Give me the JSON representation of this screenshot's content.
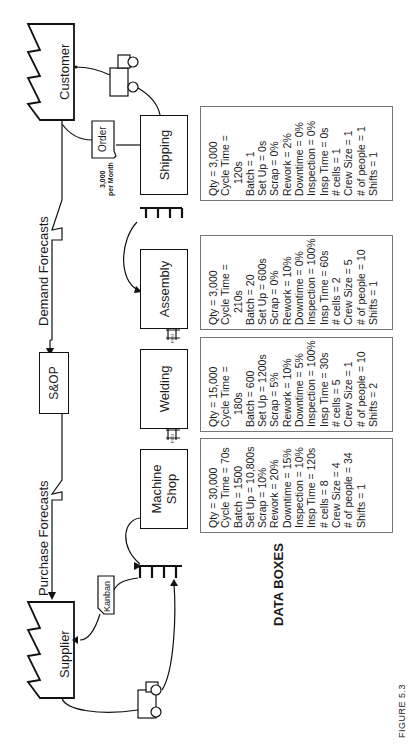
{
  "figure": {
    "caption": "FIGURE 5.3",
    "data_boxes_title": "DATA BOXES",
    "orientation": "rotated -90deg (text reads bottom-to-top)"
  },
  "entities": {
    "customer": "Customer",
    "supplier": "Supplier",
    "sop": "S&OP"
  },
  "info_flows": {
    "demand_forecasts": "Demand Forecasts",
    "purchase_forecasts": "Purchase Forecasts",
    "order_card": "Order",
    "order_volume_line1": "3,000",
    "order_volume_line2": "per Month",
    "kanban_card": "Kanban"
  },
  "fifo_label": "FIFO",
  "processes": [
    {
      "name": "Machine Shop",
      "name_line1": "Machine",
      "name_line2": "Shop",
      "data": [
        "Qty = 30,000",
        "Cycle Time = 70s",
        "Batch = 1500",
        "Set Up = 10,800s",
        "Scrap = 10%",
        "Rework = 20%",
        "Downtime = 15%",
        "Inspection = 10%",
        "Insp Time = 120s",
        "# cells = 8",
        "Crew Size = 4",
        "# of people = 34",
        "Shifts = 1"
      ]
    },
    {
      "name": "Welding",
      "data": [
        "Qty = 15,000",
        "Cycle Time =",
        "180s",
        "Batch = 600",
        "Set Up = 1200s",
        "Scrap = 5%",
        "Rework = 10%",
        "Downtime = 5%",
        "Inspection = 100%",
        "Insp Time = 30s",
        "# cells = 5",
        "Crew Size = 1",
        "# of people = 10",
        "Shifts = 2"
      ]
    },
    {
      "name": "Assembly",
      "data": [
        "Qty = 3,000",
        "Cycle Time =",
        "210s",
        "Batch = 20",
        "Set Up = 600s",
        "Scrap = 0%",
        "Rework = 10%",
        "Downtime = 0%",
        "Inspection = 100%",
        "Insp Time = 60s",
        "# cells = 2",
        "Crew Size = 5",
        "# of people = 10",
        "Shifts = 1"
      ]
    },
    {
      "name": "Shipping",
      "data": [
        "Qty = 3,000",
        "Cycle Time =",
        "120s",
        "Batch = 1",
        "Set Up = 0s",
        "Scrap = 0%",
        "Rework = 2%",
        "Downtime = 0%",
        "Inspection = 0%",
        "Insp Time = 0s",
        "# cells = 1",
        "Crew Size = 1",
        "# of people = 1",
        "Shifts = 1"
      ]
    }
  ]
}
